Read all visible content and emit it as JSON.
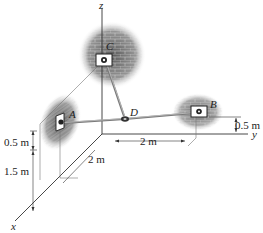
{
  "diagram": {
    "axes": {
      "x": "x",
      "y": "y",
      "z": "z"
    },
    "points": {
      "A": "A",
      "B": "B",
      "C": "C",
      "D": "D"
    },
    "dimensions": {
      "a_height_upper": "0.5 m",
      "a_height_lower": "1.5 m",
      "x_offset": "2 m",
      "y_offset": "2 m",
      "b_height": "0.5 m"
    },
    "colors": {
      "line": "#333333",
      "cable": "#777777",
      "wall_dark": "#6a6a6a",
      "wall_light": "#bdbdbd"
    }
  }
}
